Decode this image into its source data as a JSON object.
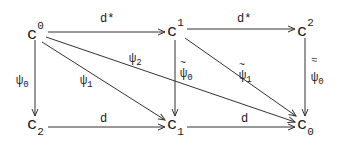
{
  "diagram": {
    "type": "commutative-diagram",
    "line_color": "#333333",
    "text_color": "#1a1a1a",
    "nodes": [
      {
        "id": "c0_sup",
        "base": "c",
        "sup": "0",
        "sub": "",
        "x": 27,
        "y": 24
      },
      {
        "id": "c1_sup",
        "base": "c",
        "sup": "1",
        "sub": "",
        "x": 167,
        "y": 24
      },
      {
        "id": "c2_sup",
        "base": "c",
        "sup": "2",
        "sub": "",
        "x": 297,
        "y": 24
      },
      {
        "id": "c2_sub",
        "base": "c",
        "sup": "",
        "sub": "2",
        "x": 27,
        "y": 121
      },
      {
        "id": "c1_sub",
        "base": "c",
        "sup": "",
        "sub": "1",
        "x": 167,
        "y": 121
      },
      {
        "id": "c0_sub",
        "base": "c",
        "sup": "",
        "sub": "0",
        "x": 297,
        "y": 121
      }
    ],
    "arrows": [
      {
        "id": "top-left",
        "from": "c0_sup",
        "to": "c1_sup",
        "label": "d*"
      },
      {
        "id": "top-right",
        "from": "c1_sup",
        "to": "c2_sup",
        "label": "d*"
      },
      {
        "id": "bottom-left",
        "from": "c2_sub",
        "to": "c1_sub",
        "label": "d"
      },
      {
        "id": "bottom-right",
        "from": "c1_sub",
        "to": "c0_sub",
        "label": "d"
      },
      {
        "id": "left-vertical",
        "from": "c0_sup",
        "to": "c2_sub",
        "label": "ψ0"
      },
      {
        "id": "middle-vertical",
        "from": "c1_sup",
        "to": "c1_sub",
        "label": "ψ̃0"
      },
      {
        "id": "right-vertical",
        "from": "c2_sup",
        "to": "c0_sub",
        "label": "ψ≈0"
      },
      {
        "id": "diag-psi1",
        "from": "c0_sup",
        "to": "c1_sub",
        "label": "ψ1"
      },
      {
        "id": "diag-psi2",
        "from": "c0_sup",
        "to": "c0_sub",
        "label": "ψ2"
      },
      {
        "id": "diag-psi1-tilde",
        "from": "c1_sup",
        "to": "c0_sub",
        "label": "ψ̃1"
      }
    ],
    "labels": {
      "d_star": "d*",
      "d": "d",
      "psi": "ψ",
      "tilde": "~",
      "double_tilde": "≈",
      "sub_0": "0",
      "sub_1": "1",
      "sub_2": "2",
      "base_c": "c",
      "sup_0": "0",
      "sup_1": "1",
      "sup_2": "2"
    }
  }
}
